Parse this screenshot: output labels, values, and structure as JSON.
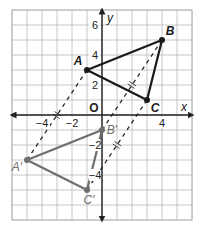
{
  "figure": {
    "colors": {
      "grid": "#b8b8b8",
      "axis": "#222222",
      "original": "#1a1a1a",
      "image": "#6e6e6e",
      "dashed": "#2a2a2a",
      "background": "#ffffff"
    },
    "axes": {
      "x_label": "x",
      "y_label": "y",
      "origin_label": "O",
      "x_range": [
        -6,
        6
      ],
      "y_range": [
        -7,
        7
      ],
      "x_ticks": [
        {
          "value": -4,
          "label": "−4"
        },
        {
          "value": -2,
          "label": "−2"
        },
        {
          "value": 4,
          "label": "4"
        }
      ],
      "y_ticks": [
        {
          "value": 6,
          "label": "6"
        },
        {
          "value": 4,
          "label": "4"
        },
        {
          "value": 2,
          "label": "2"
        },
        {
          "value": -2,
          "label": "−2"
        },
        {
          "value": -4,
          "label": "−4"
        }
      ]
    },
    "original_triangle": {
      "vertices": [
        {
          "label": "A",
          "x": -1,
          "y": 3
        },
        {
          "label": "B",
          "x": 4,
          "y": 5
        },
        {
          "label": "C",
          "x": 3,
          "y": 1
        }
      ]
    },
    "image_triangle": {
      "vertices": [
        {
          "label": "A′",
          "x": -5,
          "y": -3
        },
        {
          "label": "B′",
          "x": 0,
          "y": -1
        },
        {
          "label": "C′",
          "x": -1,
          "y": -5
        }
      ]
    },
    "translation": {
      "dx": -4,
      "dy": -6
    }
  }
}
